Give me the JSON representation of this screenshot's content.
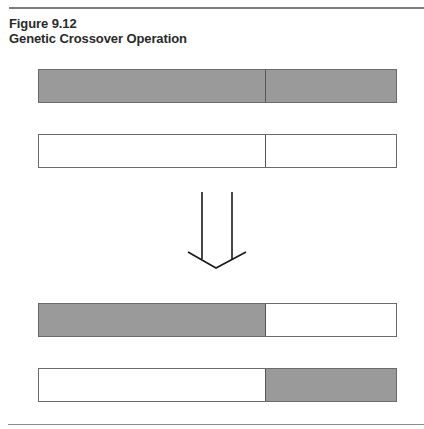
{
  "figure": {
    "number": "Figure 9.12",
    "title": "Genetic Crossover Operation"
  },
  "colors": {
    "gene_fill": "#9a9a9a",
    "empty_fill": "#ffffff",
    "outline": "#6a6a6a",
    "arrow": "#1a1a1a"
  },
  "parents": [
    {
      "label": "parent-1",
      "segments": [
        "gray",
        "gray"
      ]
    },
    {
      "label": "parent-2",
      "segments": [
        "white",
        "white"
      ]
    }
  ],
  "offspring": [
    {
      "label": "child-1",
      "segments": [
        "gray",
        "white"
      ]
    },
    {
      "label": "child-2",
      "segments": [
        "white",
        "gray"
      ]
    }
  ],
  "arrow": {
    "direction": "down",
    "icon": "down-arrow-icon"
  }
}
